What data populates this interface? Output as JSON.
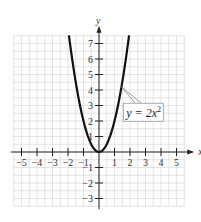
{
  "chart_data": {
    "type": "line",
    "title": "",
    "xlabel": "x",
    "ylabel": "y",
    "xlim": [
      -5.5,
      5.5
    ],
    "ylim": [
      -3.5,
      7.5
    ],
    "grid": true,
    "x_ticks": [
      -5,
      -4,
      -3,
      -2,
      -1,
      1,
      2,
      3,
      4,
      5
    ],
    "y_ticks": [
      -3,
      -2,
      -1,
      1,
      2,
      3,
      4,
      5,
      6,
      7
    ],
    "x_tick_labels": [
      "−5",
      "−4",
      "−3",
      "−2",
      "−1",
      "1",
      "2",
      "3",
      "4",
      "5"
    ],
    "y_tick_labels": [
      "−3",
      "−2",
      "−1",
      "1",
      "2",
      "3",
      "4",
      "5",
      "6",
      "7"
    ],
    "series": [
      {
        "name": "y = 2x^2",
        "function": "2*x^2",
        "x_range": [
          -1.94,
          1.94
        ],
        "points": [
          [
            -1.94,
            7.5
          ],
          [
            -1.75,
            6.125
          ],
          [
            -1.5,
            4.5
          ],
          [
            -1.25,
            3.125
          ],
          [
            -1.0,
            2.0
          ],
          [
            -0.75,
            1.125
          ],
          [
            -0.5,
            0.5
          ],
          [
            -0.25,
            0.125
          ],
          [
            0,
            0
          ],
          [
            0.25,
            0.125
          ],
          [
            0.5,
            0.5
          ],
          [
            0.75,
            1.125
          ],
          [
            1.0,
            2.0
          ],
          [
            1.25,
            3.125
          ],
          [
            1.5,
            4.5
          ],
          [
            1.75,
            6.125
          ],
          [
            1.94,
            7.5
          ]
        ]
      }
    ],
    "annotations": [
      {
        "text_prefix": "y = 2x",
        "superscript": "2",
        "points_to": [
          1.45,
          4.2
        ],
        "label_anchor": [
          2.6,
          2.5
        ]
      }
    ]
  }
}
